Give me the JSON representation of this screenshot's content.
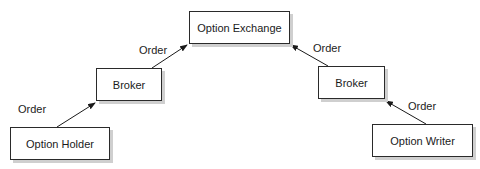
{
  "diagram": {
    "nodes": [
      {
        "id": "exchange",
        "label": "Option Exchange"
      },
      {
        "id": "broker_left",
        "label": "Broker"
      },
      {
        "id": "broker_right",
        "label": "Broker"
      },
      {
        "id": "holder",
        "label": "Option Holder"
      },
      {
        "id": "writer",
        "label": "Option Writer"
      }
    ],
    "edges": [
      {
        "from": "holder",
        "to": "broker_left",
        "label": "Order"
      },
      {
        "from": "broker_left",
        "to": "exchange",
        "label": "Order"
      },
      {
        "from": "broker_right",
        "to": "exchange",
        "label": "Order"
      },
      {
        "from": "writer",
        "to": "broker_right",
        "label": "Order"
      }
    ],
    "colors": {
      "line": "#1a1a1a",
      "shadow": "#cfcfcf",
      "background": "#ffffff"
    }
  }
}
